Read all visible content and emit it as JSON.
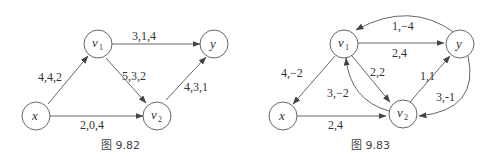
{
  "figures": [
    {
      "caption": "图 9.82",
      "nodes": [
        {
          "id": "x",
          "label": "x"
        },
        {
          "id": "v1",
          "label": "v",
          "sub": "1"
        },
        {
          "id": "v2",
          "label": "v",
          "sub": "2"
        },
        {
          "id": "y",
          "label": "y"
        }
      ],
      "edges": [
        {
          "from": "x",
          "to": "v1",
          "label": "4,4,2"
        },
        {
          "from": "v1",
          "to": "y",
          "label": "3,1,4"
        },
        {
          "from": "v1",
          "to": "v2",
          "label": "5,3,2"
        },
        {
          "from": "v2",
          "to": "y",
          "label": "4,3,1"
        },
        {
          "from": "x",
          "to": "v2",
          "label": "2,0,4"
        }
      ]
    },
    {
      "caption": "图 9.83",
      "nodes": [
        {
          "id": "x",
          "label": "x"
        },
        {
          "id": "v1",
          "label": "v",
          "sub": "1"
        },
        {
          "id": "v2",
          "label": "v",
          "sub": "2"
        },
        {
          "id": "y",
          "label": "y"
        }
      ],
      "edges": [
        {
          "from": "y",
          "to": "v1",
          "label": "1,−4"
        },
        {
          "from": "v1",
          "to": "y",
          "label": "2,4"
        },
        {
          "from": "v1",
          "to": "x",
          "label": "4,−2"
        },
        {
          "from": "v1",
          "to": "v2",
          "label": "2,2"
        },
        {
          "from": "v2",
          "to": "v1",
          "label": "3,−2"
        },
        {
          "from": "v2",
          "to": "y",
          "label": "1,1"
        },
        {
          "from": "y",
          "to": "v2",
          "label": "3,-1"
        },
        {
          "from": "x",
          "to": "v2",
          "label": "2,4"
        }
      ]
    }
  ]
}
